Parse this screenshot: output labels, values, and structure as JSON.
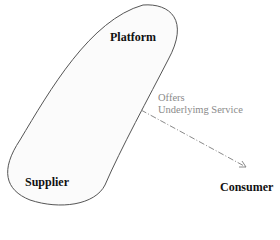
{
  "nodes": {
    "platform": {
      "label": "Platform"
    },
    "supplier": {
      "label": "Supplier"
    },
    "consumer": {
      "label": "Consumer"
    }
  },
  "edge": {
    "line1": "Offers",
    "line2": "Underlyimg Service",
    "style": "dash-dot",
    "color": "#8a8a8a"
  },
  "colors": {
    "outline": "#555555",
    "fill": "#fbfbfb"
  }
}
